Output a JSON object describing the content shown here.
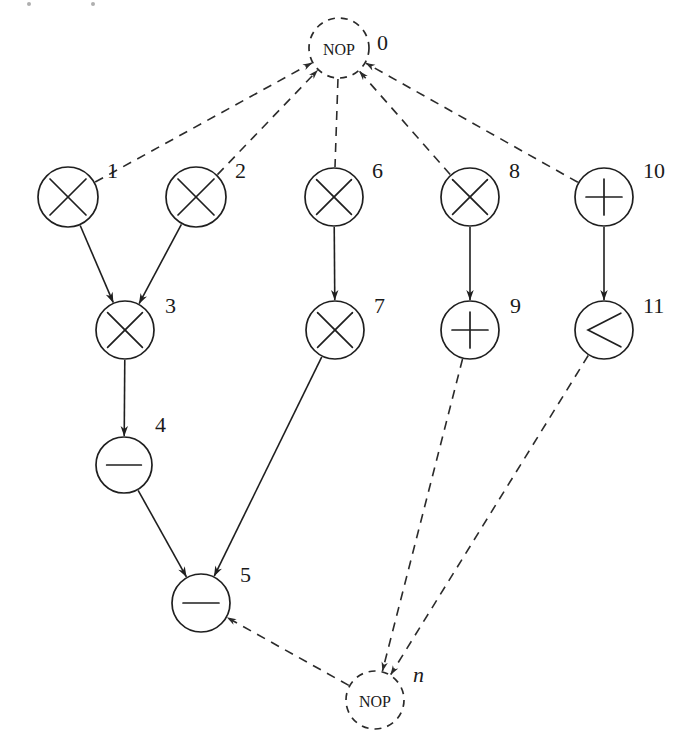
{
  "diagram": {
    "type": "directed-graph",
    "canvas": {
      "width": 691,
      "height": 748
    },
    "colors": {
      "background": "#ffffff",
      "stroke": "#1f1f1f",
      "dashed_stroke": "#2b2b2b",
      "label": "#1a1a1a"
    },
    "nodes": [
      {
        "id": "0",
        "label": "0",
        "label_style": "normal",
        "op": "NOP",
        "op_text": "NOP",
        "shape": "dashed-circle",
        "cx": 339,
        "cy": 48,
        "r": 30,
        "label_x": 377,
        "label_y": 50
      },
      {
        "id": "1",
        "label": "1",
        "label_style": "normal",
        "op": "multiply",
        "op_text": "×",
        "shape": "solid-circle",
        "cx": 68,
        "cy": 197,
        "r": 30,
        "label_x": 107,
        "label_y": 178
      },
      {
        "id": "2",
        "label": "2",
        "label_style": "normal",
        "op": "multiply",
        "op_text": "×",
        "shape": "solid-circle",
        "cx": 196,
        "cy": 197,
        "r": 30,
        "label_x": 235,
        "label_y": 178
      },
      {
        "id": "3",
        "label": "3",
        "label_style": "normal",
        "op": "multiply",
        "op_text": "×",
        "shape": "solid-circle",
        "cx": 125,
        "cy": 330,
        "r": 29,
        "label_x": 165,
        "label_y": 313
      },
      {
        "id": "4",
        "label": "4",
        "label_style": "normal",
        "op": "minus",
        "op_text": "−",
        "shape": "solid-circle",
        "cx": 124,
        "cy": 465,
        "r": 28,
        "label_x": 155,
        "label_y": 432
      },
      {
        "id": "5",
        "label": "5",
        "label_style": "normal",
        "op": "minus",
        "op_text": "−",
        "shape": "solid-circle",
        "cx": 201,
        "cy": 603,
        "r": 29,
        "label_x": 240,
        "label_y": 582
      },
      {
        "id": "6",
        "label": "6",
        "label_style": "normal",
        "op": "multiply",
        "op_text": "×",
        "shape": "solid-circle",
        "cx": 334,
        "cy": 197,
        "r": 29,
        "label_x": 372,
        "label_y": 178
      },
      {
        "id": "7",
        "label": "7",
        "label_style": "normal",
        "op": "multiply",
        "op_text": "×",
        "shape": "solid-circle",
        "cx": 335,
        "cy": 330,
        "r": 29,
        "label_x": 374,
        "label_y": 313
      },
      {
        "id": "8",
        "label": "8",
        "label_style": "normal",
        "op": "multiply",
        "op_text": "×",
        "shape": "solid-circle",
        "cx": 470,
        "cy": 197,
        "r": 29,
        "label_x": 509,
        "label_y": 178
      },
      {
        "id": "9",
        "label": "9",
        "label_style": "normal",
        "op": "plus",
        "op_text": "+",
        "shape": "solid-circle",
        "cx": 470,
        "cy": 330,
        "r": 29,
        "label_x": 510,
        "label_y": 313
      },
      {
        "id": "10",
        "label": "10",
        "label_style": "normal",
        "op": "plus",
        "op_text": "+",
        "shape": "solid-circle",
        "cx": 604,
        "cy": 197,
        "r": 29,
        "label_x": 643,
        "label_y": 178
      },
      {
        "id": "11",
        "label": "11",
        "label_style": "normal",
        "op": "less-than",
        "op_text": "<",
        "shape": "solid-circle",
        "cx": 604,
        "cy": 330,
        "r": 29,
        "label_x": 643,
        "label_y": 313
      },
      {
        "id": "n",
        "label": "n",
        "label_style": "italic",
        "op": "NOP",
        "op_text": "NOP",
        "shape": "dashed-circle",
        "cx": 375,
        "cy": 700,
        "r": 29,
        "label_x": 413,
        "label_y": 682
      }
    ],
    "edges": [
      {
        "from": "0",
        "to": "1",
        "style": "dashed",
        "arrow": "to-source"
      },
      {
        "from": "0",
        "to": "2",
        "style": "dashed",
        "arrow": "to-source"
      },
      {
        "from": "0",
        "to": "6",
        "style": "dashed",
        "arrow": "none"
      },
      {
        "from": "0",
        "to": "8",
        "style": "dashed",
        "arrow": "to-source"
      },
      {
        "from": "0",
        "to": "10",
        "style": "dashed",
        "arrow": "to-source"
      },
      {
        "from": "1",
        "to": "3",
        "style": "solid",
        "arrow": "to-target"
      },
      {
        "from": "2",
        "to": "3",
        "style": "solid",
        "arrow": "to-target"
      },
      {
        "from": "3",
        "to": "4",
        "style": "solid",
        "arrow": "to-target"
      },
      {
        "from": "4",
        "to": "5",
        "style": "solid",
        "arrow": "to-target"
      },
      {
        "from": "6",
        "to": "7",
        "style": "solid",
        "arrow": "to-target"
      },
      {
        "from": "7",
        "to": "5",
        "style": "solid",
        "arrow": "to-target"
      },
      {
        "from": "8",
        "to": "9",
        "style": "solid",
        "arrow": "to-target"
      },
      {
        "from": "10",
        "to": "11",
        "style": "solid",
        "arrow": "to-target"
      },
      {
        "from": "5",
        "to": "n",
        "style": "dashed",
        "arrow": "to-source"
      },
      {
        "from": "9",
        "to": "n",
        "style": "dashed",
        "arrow": "to-target"
      },
      {
        "from": "11",
        "to": "n",
        "style": "dashed",
        "arrow": "to-target"
      }
    ]
  }
}
